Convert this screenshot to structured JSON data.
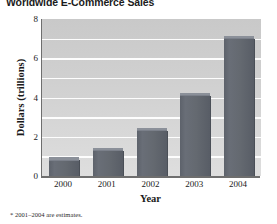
{
  "title": "Worldwide E-Commerce Sales",
  "footnote": "* 2001–2004 are estimates.",
  "colors": {
    "bar_face": "#646970",
    "bar_top": "#8b9099",
    "plot_background": "#d2d2d2",
    "gridline": "#fdfdfd",
    "axis": "#6e6e6e",
    "text": "#1a1a1a",
    "page_background": "#ffffff"
  },
  "chart_data": {
    "type": "bar",
    "title": "Worldwide E-Commerce Sales",
    "categories": [
      "2000",
      "2001",
      "2002",
      "2003",
      "2004"
    ],
    "values": [
      0.8,
      1.3,
      2.3,
      4.1,
      7.0
    ],
    "xlabel": "Year",
    "ylabel": "Dollars (trillions)",
    "ylim": [
      0,
      8
    ],
    "yticks": [
      0,
      2,
      4,
      6,
      8
    ],
    "ytick_labels": [
      "0",
      "2",
      "4",
      "6",
      "8"
    ],
    "gridlines": [
      1,
      2,
      3,
      4,
      5,
      6,
      7
    ],
    "grid": true,
    "legend": false,
    "series_name": "E-commerce sales",
    "units": "trillions of dollars",
    "annotations": [
      "* 2001–2004 are estimates."
    ]
  }
}
